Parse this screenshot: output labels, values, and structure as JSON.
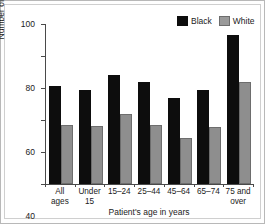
{
  "chart_data": {
    "type": "bar",
    "title": "",
    "xlabel": "Patient's age in years",
    "ylabel": "Number of visits per 100 persons",
    "categories": [
      "All ages",
      "Under 15",
      "15–24",
      "25–44",
      "45–64",
      "65–74",
      "75 and over"
    ],
    "series": [
      {
        "name": "Black",
        "color": "#0d0d0d",
        "values": [
          61.5,
          59,
          68,
          64,
          53.5,
          59,
          93
        ]
      },
      {
        "name": "White",
        "color": "#8e8e8e",
        "values": [
          37,
          36,
          44,
          37,
          29,
          35.5,
          64
        ]
      }
    ],
    "ylim": [
      0,
      100
    ],
    "yticks": [
      0,
      20,
      40,
      60,
      80,
      100
    ],
    "ytick_labels": [
      "0",
      "20",
      "40",
      "60",
      "80",
      "100"
    ],
    "grid": false,
    "legend_position": "top-right"
  },
  "legend": {
    "items": [
      {
        "label": "Black",
        "swatch": "black-swatch"
      },
      {
        "label": "White",
        "swatch": "white-swatch"
      }
    ]
  },
  "axes": {
    "y_title": "Number of visits per 100 persons",
    "x_title": "Patient's age in years"
  }
}
